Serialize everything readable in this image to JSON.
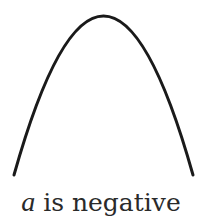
{
  "figure": {
    "curve": {
      "shape": "parabola",
      "orientation": "opens-down",
      "stroke_color": "#1a1a1a",
      "stroke_width": 3
    },
    "caption": {
      "variable": "a",
      "text": " is negative"
    }
  }
}
